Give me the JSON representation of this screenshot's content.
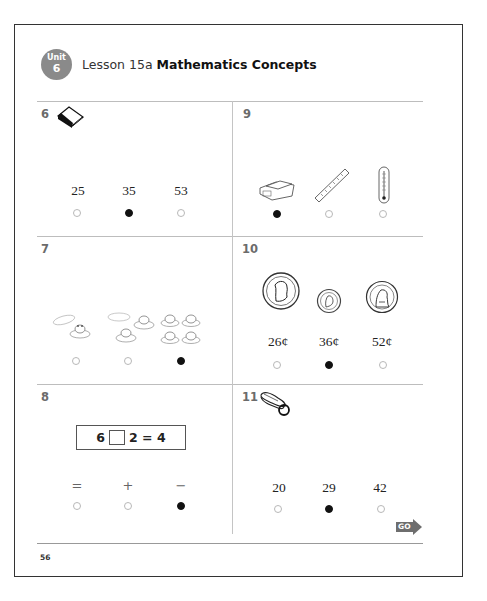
{
  "header": {
    "unit_label": "Unit",
    "unit_number": "6",
    "lesson": "Lesson 15a",
    "title": "Mathematics Concepts",
    "badge_color": "#8a8a8a"
  },
  "questions": [
    {
      "number": "6",
      "icon": "book-icon",
      "choices": [
        {
          "label": "25",
          "selected": false
        },
        {
          "label": "35",
          "selected": true
        },
        {
          "label": "53",
          "selected": false
        }
      ]
    },
    {
      "number": "7",
      "icon": "frogs-on-lily-pads",
      "choices": [
        {
          "label": "1 frog, 1 empty lily pad",
          "selected": false
        },
        {
          "label": "2 frogs, 1 empty lily pad",
          "selected": false
        },
        {
          "label": "4 frogs, 0 empty lily pads",
          "selected": true
        }
      ]
    },
    {
      "number": "8",
      "equation": {
        "left": "6",
        "right": "2 = 4"
      },
      "choices": [
        {
          "label": "=",
          "selected": false
        },
        {
          "label": "+",
          "selected": false
        },
        {
          "label": "−",
          "selected": true
        }
      ]
    },
    {
      "number": "9",
      "choices": [
        {
          "label": "scale",
          "icon": "scale-icon",
          "selected": true
        },
        {
          "label": "ruler",
          "icon": "ruler-icon",
          "selected": false
        },
        {
          "label": "thermometer",
          "icon": "thermometer-icon",
          "selected": false
        }
      ]
    },
    {
      "number": "10",
      "coins": [
        "quarter",
        "dime",
        "penny"
      ],
      "choices": [
        {
          "label": "26¢",
          "selected": false
        },
        {
          "label": "36¢",
          "selected": true
        },
        {
          "label": "52¢",
          "selected": false
        }
      ]
    },
    {
      "number": "11",
      "icon": "stapler-icon",
      "choices": [
        {
          "label": "20",
          "selected": false
        },
        {
          "label": "29",
          "selected": true
        },
        {
          "label": "42",
          "selected": false
        }
      ]
    }
  ],
  "footer": {
    "go_label": "GO",
    "page_number": "56"
  }
}
